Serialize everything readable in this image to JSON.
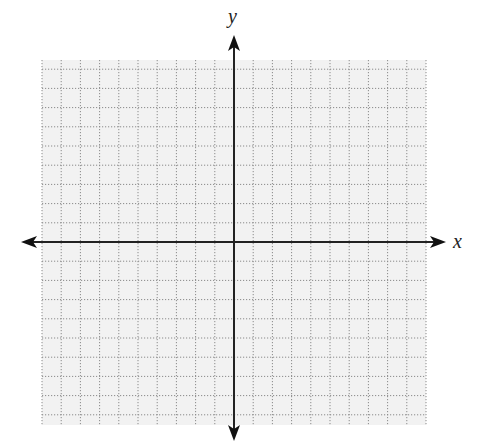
{
  "figure": {
    "type": "coordinate-plane",
    "axes": {
      "x_label": "x",
      "y_label": "y"
    },
    "grid": {
      "left": 42,
      "top": 60,
      "right": 426,
      "bottom": 425,
      "origin_x": 234,
      "origin_y": 242,
      "cell": 19.2,
      "line_color": "#8a8a8a",
      "background": "#f2f2f2"
    },
    "colors": {
      "axis": "#222222",
      "grid": "#8a8a8a",
      "background": "#f2f2f2"
    }
  }
}
